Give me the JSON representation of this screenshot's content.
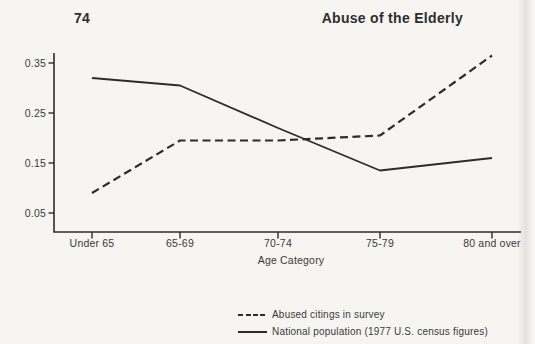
{
  "page": {
    "page_number": "74",
    "running_title": "Abuse of the Elderly"
  },
  "chart_data": {
    "type": "line",
    "categories": [
      "Under 65",
      "65-69",
      "70-74",
      "75-79",
      "80 and over"
    ],
    "series": [
      {
        "name": "Abused citings in survey",
        "line_style": "dashed",
        "values": [
          0.09,
          0.195,
          0.195,
          0.205,
          0.365
        ]
      },
      {
        "name": "National population (1977 U.S. census figures)",
        "line_style": "solid",
        "values": [
          0.32,
          0.305,
          0.22,
          0.135,
          0.16
        ]
      }
    ],
    "title": "",
    "xlabel": "Age Category",
    "ylabel": "",
    "yticks": [
      0.05,
      0.15,
      0.25,
      0.35
    ],
    "ylim": [
      0.01,
      0.37
    ],
    "grid": false,
    "legend_position": "bottom",
    "ink_color": "#2c2c2c"
  }
}
